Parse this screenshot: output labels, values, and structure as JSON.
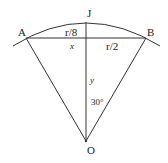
{
  "diagram": {
    "points": {
      "A": "A",
      "B": "B",
      "J": "J",
      "O": "O"
    },
    "labels": {
      "r8": "r/8",
      "r2": "r/2",
      "x": "x",
      "y": "y",
      "angle": "30°"
    },
    "stroke_color": "#333333"
  }
}
